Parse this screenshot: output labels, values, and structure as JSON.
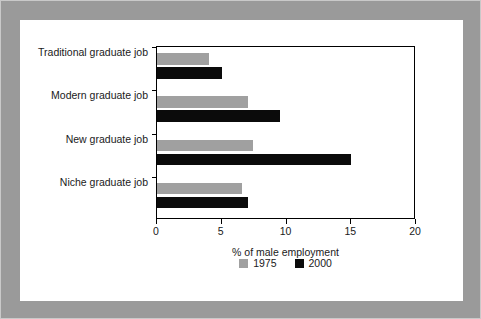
{
  "chart_data": {
    "type": "bar",
    "orientation": "horizontal",
    "title": "",
    "xlabel": "% of male employment",
    "ylabel": "",
    "xlim": [
      0,
      20
    ],
    "xticks": [
      0,
      5,
      10,
      15,
      20
    ],
    "xtick_labels": [
      "0",
      "5",
      "10",
      "15",
      "20"
    ],
    "grid": false,
    "legend_position": "bottom-center",
    "categories": [
      "Traditional graduate job",
      "Modern graduate job",
      "New graduate job",
      "Niche graduate job"
    ],
    "series": [
      {
        "name": "1975",
        "color": "#a0a0a0",
        "values": [
          4.0,
          7.0,
          7.4,
          6.6
        ]
      },
      {
        "name": "2000",
        "color": "#0b0b0b",
        "values": [
          5.0,
          9.5,
          15.0,
          7.0
        ]
      }
    ]
  },
  "legend": {
    "entries": [
      {
        "label": "1975"
      },
      {
        "label": "2000"
      }
    ]
  },
  "colors": {
    "frame": "#9a9a9a",
    "canvas": "#ffffff",
    "axis": "#000000",
    "series_1975": "#a0a0a0",
    "series_2000": "#0b0b0b"
  }
}
